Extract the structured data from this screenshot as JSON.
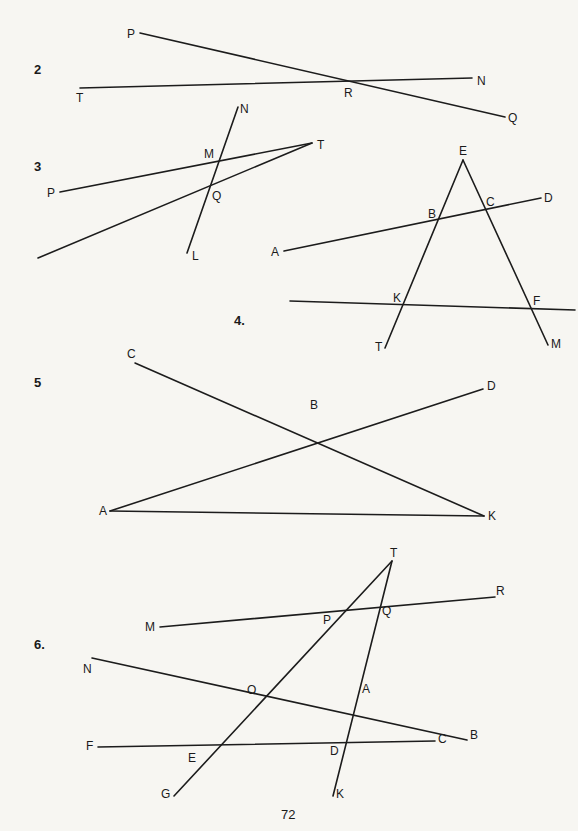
{
  "page_number": "72",
  "problems": [
    {
      "number": "2",
      "lines": [
        [
          "P",
          "Q"
        ],
        [
          "T",
          "N"
        ]
      ],
      "points": {
        "P": [
          140,
          33
        ],
        "Q": [
          505,
          117
        ],
        "T": [
          80,
          88
        ],
        "N": [
          472,
          78
        ],
        "R": [
          348,
          82
        ]
      },
      "labels": [
        {
          "t": "P",
          "x": 127,
          "y": 28
        },
        {
          "t": "T",
          "x": 76,
          "y": 92
        },
        {
          "t": "R",
          "x": 344,
          "y": 87
        },
        {
          "t": "N",
          "x": 477,
          "y": 75
        },
        {
          "t": "Q",
          "x": 508,
          "y": 112
        }
      ]
    },
    {
      "number": "3",
      "lines": [
        [
          "N",
          "L"
        ],
        [
          "P",
          "T"
        ],
        [
          "T",
          "X"
        ]
      ],
      "points": {
        "N": [
          238,
          107
        ],
        "L": [
          187,
          253
        ],
        "T": [
          312,
          143
        ],
        "P": [
          60,
          192
        ],
        "X": [
          38,
          258
        ],
        "M": [
          218,
          161
        ],
        "Q": [
          210,
          187
        ]
      },
      "labels": [
        {
          "t": "N",
          "x": 240,
          "y": 103
        },
        {
          "t": "T",
          "x": 317,
          "y": 139
        },
        {
          "t": "M",
          "x": 204,
          "y": 148
        },
        {
          "t": "P",
          "x": 47,
          "y": 187
        },
        {
          "t": "Q",
          "x": 212,
          "y": 190
        },
        {
          "t": "L",
          "x": 192,
          "y": 250
        }
      ]
    },
    {
      "number": "4.",
      "lines": [
        [
          "E",
          "T"
        ],
        [
          "E",
          "M"
        ],
        [
          "A",
          "D"
        ],
        [
          "H1",
          "H2"
        ]
      ],
      "points": {
        "E": [
          463,
          160
        ],
        "T": [
          385,
          348
        ],
        "M": [
          548,
          345
        ],
        "A": [
          284,
          251
        ],
        "D": [
          541,
          198
        ],
        "H1": [
          290,
          301
        ],
        "H2": [
          575,
          310
        ],
        "B": [
          437,
          220
        ],
        "C": [
          486,
          210
        ],
        "K": [
          404,
          305
        ],
        "F": [
          531,
          309
        ]
      },
      "labels": [
        {
          "t": "E",
          "x": 459,
          "y": 145
        },
        {
          "t": "B",
          "x": 428,
          "y": 208
        },
        {
          "t": "C",
          "x": 486,
          "y": 196
        },
        {
          "t": "D",
          "x": 544,
          "y": 192
        },
        {
          "t": "A",
          "x": 271,
          "y": 246
        },
        {
          "t": "K",
          "x": 393,
          "y": 292
        },
        {
          "t": "F",
          "x": 533,
          "y": 295
        },
        {
          "t": "T",
          "x": 375,
          "y": 341
        },
        {
          "t": "M",
          "x": 551,
          "y": 338
        }
      ]
    },
    {
      "number": "5",
      "lines": [
        [
          "C",
          "K"
        ],
        [
          "A",
          "D"
        ],
        [
          "A",
          "K"
        ]
      ],
      "points": {
        "C": [
          135,
          363
        ],
        "K": [
          484,
          516
        ],
        "A": [
          110,
          511
        ],
        "D": [
          483,
          389
        ],
        "B": [
          315,
          416
        ]
      },
      "labels": [
        {
          "t": "C",
          "x": 127,
          "y": 348
        },
        {
          "t": "D",
          "x": 487,
          "y": 380
        },
        {
          "t": "B",
          "x": 310,
          "y": 399
        },
        {
          "t": "A",
          "x": 99,
          "y": 505
        },
        {
          "t": "K",
          "x": 488,
          "y": 510
        }
      ]
    },
    {
      "number": "6.",
      "lines": [
        [
          "T",
          "G"
        ],
        [
          "T",
          "K"
        ],
        [
          "M",
          "R"
        ],
        [
          "N",
          "B"
        ],
        [
          "F",
          "C"
        ]
      ],
      "points": {
        "T": [
          392,
          561
        ],
        "G": [
          174,
          796
        ],
        "K": [
          333,
          796
        ],
        "M": [
          160,
          627
        ],
        "R": [
          495,
          597
        ],
        "N": [
          92,
          658
        ],
        "B": [
          467,
          740
        ],
        "F": [
          98,
          747
        ],
        "C": [
          435,
          741
        ]
      },
      "labels": [
        {
          "t": "T",
          "x": 390,
          "y": 547
        },
        {
          "t": "R",
          "x": 496,
          "y": 585
        },
        {
          "t": "M",
          "x": 145,
          "y": 621
        },
        {
          "t": "P",
          "x": 323,
          "y": 614
        },
        {
          "t": "Q",
          "x": 382,
          "y": 605
        },
        {
          "t": "N",
          "x": 83,
          "y": 663
        },
        {
          "t": "O",
          "x": 247,
          "y": 684
        },
        {
          "t": "A",
          "x": 362,
          "y": 683
        },
        {
          "t": "B",
          "x": 470,
          "y": 729
        },
        {
          "t": "F",
          "x": 86,
          "y": 740
        },
        {
          "t": "C",
          "x": 438,
          "y": 733
        },
        {
          "t": "E",
          "x": 188,
          "y": 752
        },
        {
          "t": "D",
          "x": 330,
          "y": 745
        },
        {
          "t": "G",
          "x": 161,
          "y": 788
        },
        {
          "t": "K",
          "x": 336,
          "y": 788
        }
      ]
    }
  ],
  "problem_label_positions": [
    [
      34,
      63
    ],
    [
      34,
      160
    ],
    [
      234,
      314
    ],
    [
      34,
      376
    ],
    [
      34,
      638
    ]
  ]
}
